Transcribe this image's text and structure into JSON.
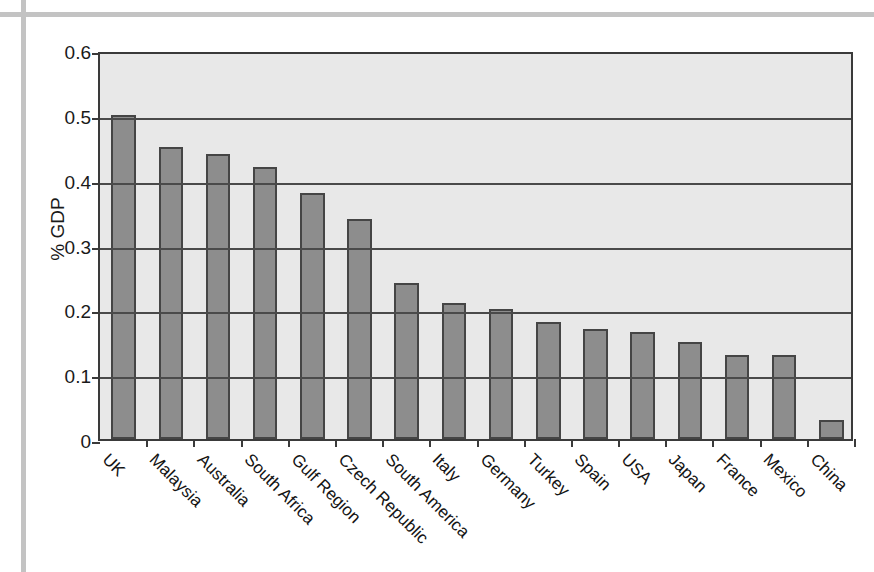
{
  "figure": {
    "caption_visible_fragment": "",
    "ylabel": "% GDP"
  },
  "chart_data": {
    "type": "bar",
    "title": "",
    "xlabel": "",
    "ylabel": "% GDP",
    "ylim": [
      0,
      0.6
    ],
    "ytick_labels": [
      "0.6",
      "0.5",
      "0.4",
      "0.3",
      "0.2",
      "0.1",
      "0"
    ],
    "yticks": [
      0.6,
      0.5,
      0.4,
      0.3,
      0.2,
      0.1,
      0
    ],
    "grid": true,
    "legend": "none",
    "bar_color": "#8d8d8d",
    "bar_edge_color": "#454545",
    "plot_background": "#e8e8e8",
    "categories": [
      "UK",
      "Malaysia",
      "Australia",
      "South Africa",
      "Gulf Region",
      "Czech Republic",
      "South America",
      "Italy",
      "Germany",
      "Turkey",
      "Spain",
      "USA",
      "Japan",
      "France",
      "Mexico",
      "China"
    ],
    "values": [
      0.5,
      0.45,
      0.44,
      0.42,
      0.38,
      0.34,
      0.24,
      0.21,
      0.2,
      0.18,
      0.17,
      0.165,
      0.15,
      0.13,
      0.13,
      0.03
    ]
  }
}
